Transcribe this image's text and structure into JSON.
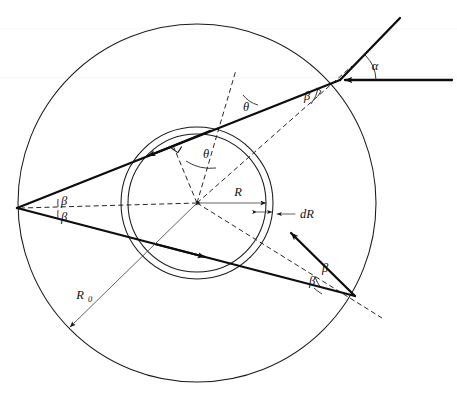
{
  "figure": {
    "type": "optics-ray-diagram",
    "background_color": "#ffffff",
    "ink_color": "#111111"
  },
  "geometry": {
    "center": {
      "x": 197,
      "y": 203
    },
    "outer_circle": {
      "label_ref": "R0",
      "radius": 179
    },
    "shell_inner_circle": {
      "radius": 69
    },
    "shell_outer_circle": {
      "radius": 76
    },
    "entry_point": {
      "x": 340,
      "y": 80
    },
    "left_vertex": {
      "x": 17,
      "y": 208
    },
    "exit_point": {
      "x": 355,
      "y": 296
    }
  },
  "labels": {
    "alpha": "α",
    "theta_upper": "θ",
    "theta_inner": "θ",
    "beta_entry": "β",
    "beta_left_upper": "β",
    "beta_left_lower": "β",
    "beta_exit_upper": "β",
    "beta_exit_lower": "β",
    "radius_R": "R",
    "thickness_dR": "dR",
    "radius_R0": "R",
    "radius_R0_subscript": "0"
  },
  "elements": {
    "incident_ray": "incoming horizontal ray from the right with leftward arrowhead",
    "refracted_ray_upper": "ray from entry point travelling up-right out of the figure",
    "chord_ray_upper": "ray crossing the shell toward the upper-left with arrowhead",
    "chord_ray_lower": "ray returning to the lower-right with arrowhead",
    "exit_ray": "short ray leaving the exit point toward the upper-left with arrowhead",
    "normal_dashes": "dashed radial normals at entry, shell crossing and exit",
    "right_angle_marker": "small square marking the perpendicular at the shell",
    "R_measure": "double headed arrow from centre to the shell labelled R",
    "dR_measure": "short double headed arrow spanning the shell thickness labelled dR",
    "R0_measure": "arrow from centre to the outer circle labelled R0"
  }
}
